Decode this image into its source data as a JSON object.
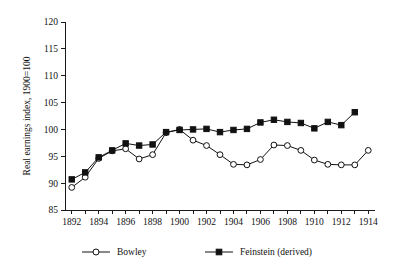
{
  "chart_data": {
    "type": "line",
    "title": "",
    "xlabel": "",
    "ylabel": "Real earnings index, 1900=100",
    "xlim": [
      1891.5,
      1914.5
    ],
    "ylim": [
      85,
      120
    ],
    "yticks": [
      85,
      90,
      95,
      100,
      105,
      110,
      115,
      120
    ],
    "ytick_labels": [
      "85",
      "90",
      "95",
      "100",
      "105",
      "110",
      "115",
      "120"
    ],
    "xticks": [
      1892,
      1893,
      1894,
      1895,
      1896,
      1897,
      1898,
      1899,
      1900,
      1901,
      1902,
      1903,
      1904,
      1905,
      1906,
      1907,
      1908,
      1909,
      1910,
      1911,
      1912,
      1913,
      1914
    ],
    "xtick_labels": [
      "1892",
      "",
      "1894",
      "",
      "1896",
      "",
      "1898",
      "",
      "1900",
      "",
      "1902",
      "",
      "1904",
      "",
      "1906",
      "",
      "1908",
      "",
      "1910",
      "",
      "1912",
      "",
      "1914"
    ],
    "grid": false,
    "legend_position": "below",
    "series": [
      {
        "name": "Bowley",
        "marker": "open-circle",
        "x": [
          1892,
          1893,
          1894,
          1895,
          1896,
          1897,
          1898,
          1899,
          1900,
          1901,
          1902,
          1903,
          1904,
          1905,
          1906,
          1907,
          1908,
          1909,
          1910,
          1911,
          1912,
          1913,
          1914
        ],
        "values": [
          89.2,
          91.1,
          94.6,
          96.0,
          96.4,
          94.5,
          95.3,
          99.4,
          100.0,
          98.0,
          97.0,
          95.3,
          93.5,
          93.4,
          94.4,
          97.1,
          97.0,
          96.1,
          94.3,
          93.5,
          93.4,
          93.4,
          96.1
        ]
      },
      {
        "name": "Feinstein (derived)",
        "marker": "filled-square",
        "x": [
          1892,
          1893,
          1894,
          1895,
          1896,
          1897,
          1898,
          1899,
          1900,
          1901,
          1902,
          1903,
          1904,
          1905,
          1906,
          1907,
          1908,
          1909,
          1910,
          1911,
          1912,
          1913
        ],
        "values": [
          90.7,
          92.0,
          94.8,
          96.1,
          97.4,
          97.0,
          97.2,
          99.5,
          99.9,
          100.0,
          100.1,
          99.5,
          99.9,
          100.1,
          101.3,
          101.8,
          101.4,
          101.2,
          100.2,
          101.4,
          100.8,
          103.2
        ]
      }
    ],
    "legend": [
      {
        "label": "Bowley",
        "marker": "open-circle"
      },
      {
        "label": "Feinstein (derived)",
        "marker": "filled-square"
      }
    ],
    "colors": {
      "axis": "#111111",
      "series_line": "#111111",
      "marker_fill_open": "#ffffff",
      "marker_fill_closed": "#111111",
      "background": "#ffffff"
    }
  }
}
